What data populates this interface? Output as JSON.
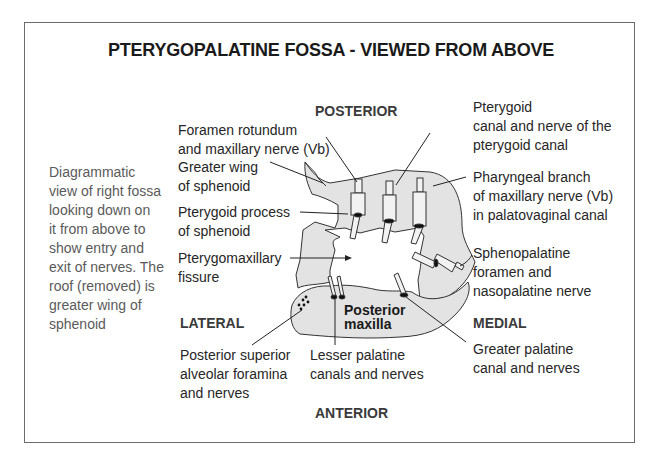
{
  "title": "PTERYGOPALATINE FOSSA - VIEWED FROM ABOVE",
  "directions": {
    "posterior": "POSTERIOR",
    "anterior": "ANTERIOR",
    "lateral": "LATERAL",
    "medial": "MEDIAL"
  },
  "description": "Diagrammatic\nview of right fossa\nlooking down on\nit from above to\nshow entry and\nexit of nerves. The\nroof (removed) is\ngreater wing of\nsphenoid",
  "structure_label": "Posterior\nmaxilla",
  "labels": {
    "foramen_rotundum": "Foramen rotundum\nand maxillary nerve (Vb)",
    "greater_wing": "Greater wing\nof sphenoid",
    "pterygoid_process": "Pterygoid process\nof sphenoid",
    "pterygomaxillary_fissure": "Pterygomaxillary\nfissure",
    "pterygoid_canal": "Pterygoid\ncanal and nerve of the\npterygoid canal",
    "pharyngeal_branch": "Pharyngeal branch\nof maxillary nerve (Vb)\nin palatovaginal canal",
    "sphenopalatine_foramen": "Sphenopalatine\nforamen and\nnasopalatine nerve",
    "psa_foramina": "Posterior superior\nalveolar foramina\nand nerves",
    "lesser_palatine": "Lesser palatine\ncanals and nerves",
    "greater_palatine": "Greater palatine\ncanal and nerves"
  },
  "colors": {
    "bone_fill": "#e3e3e3",
    "outline": "#333333",
    "text": "#262626",
    "description_text": "#5a5a5a"
  }
}
